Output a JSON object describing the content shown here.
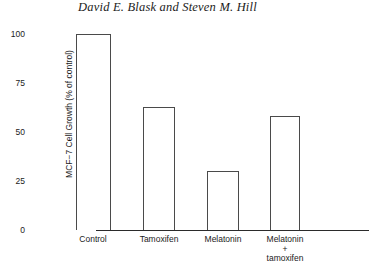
{
  "header": {
    "title": "David E. Blask and Steven M. Hill"
  },
  "chart_data": {
    "type": "bar",
    "title": "",
    "xlabel": "",
    "ylabel": "MCF−7 Cell Growth (% of control)",
    "categories": [
      "Control",
      "Tamoxifen",
      "Melatonin",
      "Melatonin\n+\ntamoxifen"
    ],
    "category_lines": [
      [
        "Control"
      ],
      [
        "Tamoxifen"
      ],
      [
        "Melatonin"
      ],
      [
        "Melatonin",
        "+",
        "tamoxifen"
      ]
    ],
    "values": [
      100,
      63,
      30,
      58
    ],
    "ylim": [
      0,
      100
    ],
    "yticks": [
      0,
      25,
      50,
      75,
      100
    ],
    "ytick_labels": [
      "0",
      "25",
      "50",
      "75",
      "100"
    ],
    "grid": false,
    "legend": false,
    "bar_style": "open-outline",
    "bar_fill_color": "#ffffff",
    "bar_edge_color": "#4a4a4a",
    "axis_color": "#2b2b2b"
  }
}
